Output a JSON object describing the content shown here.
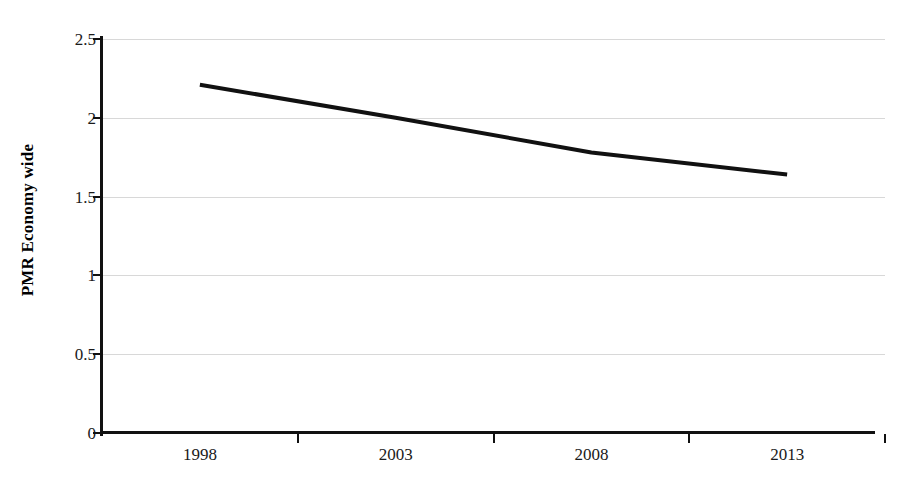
{
  "chart_data": {
    "type": "line",
    "title": "",
    "subtitle": "",
    "xlabel": "",
    "ylabel": "PMR Economy wide",
    "categories": [
      "1998",
      "2003",
      "2008",
      "2013"
    ],
    "x": [
      1998,
      2003,
      2008,
      2013
    ],
    "values": [
      2.21,
      2.0,
      1.78,
      1.64
    ],
    "series": [
      {
        "name": "PMR Economy wide",
        "values": [
          2.21,
          2.0,
          1.78,
          1.64
        ],
        "color": "#111111",
        "line_width": 4,
        "markers": false
      }
    ],
    "ylim": [
      0,
      2.5
    ],
    "ytick_values": [
      0,
      0.5,
      1,
      1.5,
      2,
      2.5
    ],
    "ytick_labels": [
      "0",
      "0.5",
      "1",
      "1.5",
      "2",
      "2.5"
    ],
    "xtick_labels": [
      "1998",
      "2003",
      "2008",
      "2013"
    ],
    "grid": true,
    "grid_axis": "y",
    "grid_color": "#d8d8d8",
    "legend": false,
    "legend_position": "none",
    "background_color": "#ffffff",
    "axis_color": "#111111",
    "annotations": []
  },
  "axis": {
    "y_title": "PMR Economy wide",
    "y_ticks": [
      {
        "label": "2.5",
        "value": 2.5
      },
      {
        "label": "2",
        "value": 2
      },
      {
        "label": "1.5",
        "value": 1.5
      },
      {
        "label": "1",
        "value": 1
      },
      {
        "label": "0.5",
        "value": 0.5
      },
      {
        "label": "0",
        "value": 0
      }
    ],
    "x_ticks": [
      {
        "label": "1998"
      },
      {
        "label": "2003"
      },
      {
        "label": "2008"
      },
      {
        "label": "2013"
      }
    ]
  }
}
